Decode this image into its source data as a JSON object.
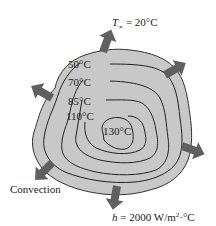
{
  "diagram": {
    "title_ambient_symbol": "T",
    "title_ambient_sub": "∞",
    "ambient_value": " = 20°C",
    "isotherms": [
      {
        "label": "50°C"
      },
      {
        "label": "70°C"
      },
      {
        "label": "85°C"
      },
      {
        "label": "110°C"
      },
      {
        "label": "130°C"
      }
    ],
    "convection_label": "Convection",
    "h_symbol": "h",
    "h_value": " = 2000 W/m",
    "h_exp": "2",
    "h_unit_tail": "·°C",
    "colors": {
      "body_fill": "#c8c8c8",
      "arrow": "#606060",
      "line": "#222222"
    }
  }
}
